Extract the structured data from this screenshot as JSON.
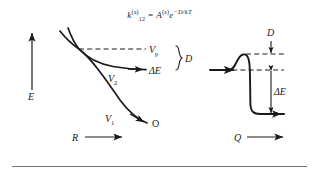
{
  "figure": {
    "equation": {
      "lhs_symbol": "k",
      "lhs_sup": "(a)",
      "lhs_sub": "12",
      "equals": "=",
      "rhs_symbol": "A",
      "rhs_sup": "(a)",
      "rhs_base": "e",
      "rhs_exponent": "−D/kT",
      "plain": "k(a)12 = A(a)e−D/kT"
    },
    "left_panel": {
      "name": "potential-energy-curves",
      "y_axis_label": "E",
      "x_axis_label": "R",
      "curve_upper_label": "V",
      "curve_upper_sub": "2",
      "curve_lower_label": "V",
      "curve_lower_sub": "1",
      "crossing_level_label": "V",
      "crossing_level_sub": "p",
      "energy_gap_label": "ΔE",
      "brace_label": "D",
      "outcome_label": "O"
    },
    "right_panel": {
      "name": "reaction-coordinate-profile",
      "x_axis_label": "Q",
      "barrier_label": "D",
      "drop_label": "ΔE"
    },
    "colors": {
      "ink": "#1a1a1a",
      "rule": "#757575",
      "background": "#ffffff"
    }
  }
}
